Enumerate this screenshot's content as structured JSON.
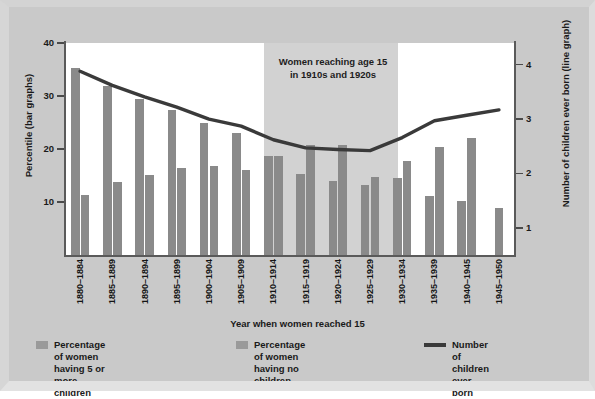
{
  "chart_data": {
    "type": "bar",
    "title": "",
    "annotation": "Women reaching age 15\nin 1910s and 1920s",
    "xlabel": "Year when women reached 15",
    "ylabel": "Percentile (bar graphs)",
    "ylabel_right": "Number of children ever born (line graph)",
    "categories": [
      "1880–1884",
      "1885–1889",
      "1890–1894",
      "1895–1899",
      "1900–1904",
      "1905–1909",
      "1910–1914",
      "1915–1919",
      "1920–1924",
      "1925–1929",
      "1930–1934",
      "1935–1939",
      "1940–1945",
      "1945–1950"
    ],
    "ylim": [
      0,
      40
    ],
    "yticks": [
      10,
      20,
      30,
      40
    ],
    "ylim_right": [
      0.5,
      4.4
    ],
    "yticks_right": [
      1,
      2,
      3,
      4
    ],
    "grid": false,
    "legend_position": "bottom",
    "series": [
      {
        "name": "Percentage of women having 5 or more children",
        "type": "bar",
        "axis": "left",
        "color": "#8a8a8a",
        "values": [
          35.3,
          31.9,
          29.4,
          27.3,
          24.9,
          23.1,
          18.7,
          15.2,
          14.0,
          13.2,
          14.5,
          11.2,
          10.1,
          8.8
        ]
      },
      {
        "name": "Percentage of women having no children",
        "type": "bar",
        "axis": "left",
        "color": "#8a8a8a",
        "values": [
          11.3,
          13.8,
          15.1,
          16.5,
          16.7,
          16.1,
          18.7,
          20.7,
          20.8,
          14.7,
          17.8,
          20.3,
          22.0,
          8.8
        ]
      },
      {
        "name": "Number of children ever born",
        "type": "line",
        "axis": "right",
        "color": "#3a3a3a",
        "values": [
          3.88,
          3.62,
          3.41,
          3.22,
          3.0,
          2.87,
          2.62,
          2.47,
          2.44,
          2.42,
          2.66,
          2.97,
          3.07,
          3.17
        ]
      }
    ],
    "shaded_region": {
      "from": "1910–1914",
      "to": "1925–1929",
      "color": "#d2d2d2"
    }
  },
  "legend": [
    {
      "icon": "bar-swatch-icon",
      "label": "Percentage of women\nhaving 5 or more children"
    },
    {
      "icon": "bar-swatch-icon",
      "label": "Percentage of women\nhaving no children"
    },
    {
      "icon": "line-swatch-icon",
      "label": "Number of children ever born"
    }
  ]
}
